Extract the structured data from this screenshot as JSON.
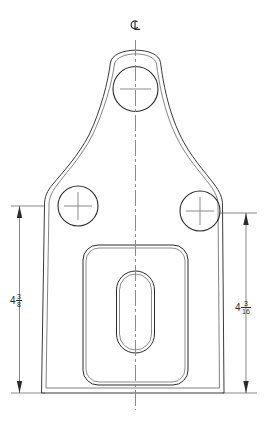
{
  "drawing": {
    "type": "mechanical-part-orthographic-view",
    "title": "",
    "background_color": "#ffffff",
    "line_color": "#3a3a3a",
    "outline_color": "#2b2b2b",
    "centerline_color": "#8a8a8a",
    "dimension_color": "#555555",
    "text_color": "#2b2b2b"
  },
  "symbols": {
    "centerline_symbol": "centerline-symbol",
    "centerline_label": "CL"
  },
  "dimensions": [
    {
      "id": "left-height",
      "name": "dimension-left-height",
      "whole": "4",
      "numerator": "3",
      "denominator": "8",
      "full_text": "4 3/8",
      "orientation": "vertical",
      "side": "left",
      "arrow_style": "filled-triangle-both-ends"
    },
    {
      "id": "right-height",
      "name": "dimension-right-height",
      "whole": "4",
      "numerator": "3",
      "denominator": "16",
      "full_text": "4 3/16",
      "orientation": "vertical",
      "side": "right",
      "arrow_style": "filled-triangle-both-ends"
    }
  ],
  "features": [
    {
      "name": "top-hole",
      "shape": "circle",
      "cx": 135.5,
      "cy": 89,
      "r": 22.5,
      "center_mark": true
    },
    {
      "name": "left-hole",
      "shape": "circle",
      "cx": 78,
      "cy": 206,
      "r": 20,
      "center_mark": true
    },
    {
      "name": "right-hole",
      "shape": "circle",
      "cx": 200,
      "cy": 211,
      "r": 20,
      "center_mark": true
    },
    {
      "name": "center-pocket",
      "shape": "rounded-rectangle",
      "x": 83,
      "y": 245,
      "width": 105,
      "height": 140,
      "radius": 14
    },
    {
      "name": "center-slot",
      "shape": "obround-slot",
      "cx": 135.5,
      "cy": 312,
      "width": 38,
      "height": 82
    },
    {
      "name": "part-outline",
      "shape": "bracket-profile",
      "double_line": true
    }
  ]
}
